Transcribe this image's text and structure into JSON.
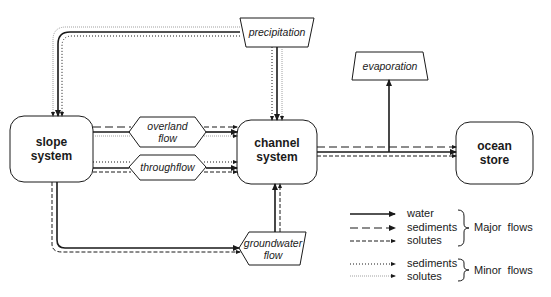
{
  "nodes": {
    "slope": {
      "line1": "slope",
      "line2": "system"
    },
    "channel": {
      "line1": "channel",
      "line2": "system"
    },
    "ocean": {
      "line1": "ocean",
      "line2": "store"
    },
    "precipitation": "precipitation",
    "evaporation": "evaporation",
    "overland": {
      "line1": "overland",
      "line2": "flow"
    },
    "throughflow": "throughflow",
    "groundwater": {
      "line1": "groundwater",
      "line2": "flow"
    }
  },
  "legend": {
    "major": {
      "items": [
        "water",
        "sediments",
        "solutes"
      ],
      "label": "Major  flows"
    },
    "minor": {
      "items": [
        "sediments",
        "solutes"
      ],
      "label": "Minor  flows"
    }
  },
  "colors": {
    "line": "#1a1a1a",
    "light": "#777777"
  }
}
